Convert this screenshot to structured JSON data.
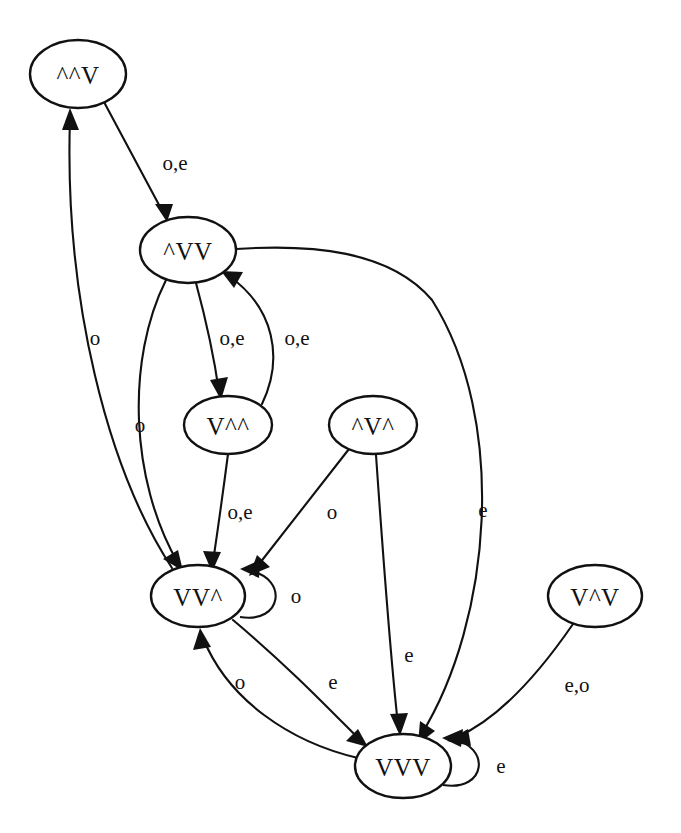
{
  "diagram": {
    "type": "finite-state-machine",
    "title": "",
    "background_color": "#ffffff",
    "line_color": "#111111",
    "node_fill": "#ffffff",
    "nodes": [
      {
        "id": "n0",
        "label": "^^V",
        "cx": 78,
        "cy": 74,
        "rx": 48,
        "ry": 34
      },
      {
        "id": "n1",
        "label": "^VV",
        "cx": 188,
        "cy": 250,
        "rx": 48,
        "ry": 33
      },
      {
        "id": "n2",
        "label": "V^^",
        "cx": 228,
        "cy": 425,
        "rx": 44,
        "ry": 29
      },
      {
        "id": "n3",
        "label": "^V^",
        "cx": 373,
        "cy": 425,
        "rx": 44,
        "ry": 29
      },
      {
        "id": "n4",
        "label": "VV^",
        "cx": 198,
        "cy": 596,
        "rx": 47,
        "ry": 31
      },
      {
        "id": "n5",
        "label": "V^V",
        "cx": 595,
        "cy": 596,
        "rx": 47,
        "ry": 31
      },
      {
        "id": "n6",
        "label": "VVV",
        "cx": 403,
        "cy": 766,
        "rx": 48,
        "ry": 32
      }
    ],
    "edges": [
      {
        "id": "e0",
        "from": "^^V",
        "to": "^VV",
        "label": "o,e",
        "lx": 175,
        "ly": 163
      },
      {
        "id": "e1",
        "from": "VV^",
        "to": "^^V",
        "label": "o",
        "lx": 95,
        "ly": 338
      },
      {
        "id": "e2",
        "from": "^VV",
        "to": "V^^",
        "label": "o,e",
        "lx": 232,
        "ly": 338
      },
      {
        "id": "e3",
        "from": "V^^",
        "to": "^VV",
        "label": "o,e",
        "lx": 297,
        "ly": 338
      },
      {
        "id": "e4",
        "from": "^VV",
        "to": "VV^",
        "label": "o",
        "lx": 140,
        "ly": 425
      },
      {
        "id": "e5",
        "from": "V^^",
        "to": "VV^",
        "label": "o,e",
        "lx": 240,
        "ly": 512
      },
      {
        "id": "e6",
        "from": "^V^",
        "to": "VV^",
        "label": "o",
        "lx": 332,
        "ly": 512
      },
      {
        "id": "e7",
        "from": "^V^",
        "to": "VVV",
        "label": "e",
        "lx": 409,
        "ly": 655
      },
      {
        "id": "e8",
        "from": "VVV",
        "to": "^VV",
        "label": "e",
        "lx": 483,
        "ly": 510
      },
      {
        "id": "e9",
        "from": "VVV",
        "to": "VV^",
        "label": "o",
        "lx": 240,
        "ly": 682
      },
      {
        "id": "e10",
        "from": "VV^",
        "to": "VVV",
        "label": "e",
        "lx": 333,
        "ly": 682
      },
      {
        "id": "e11",
        "from": "V^V",
        "to": "VVV",
        "label": "e,o",
        "lx": 577,
        "ly": 685
      },
      {
        "id": "e12",
        "from": "VV^",
        "to": "VV^",
        "label": "o",
        "lx": 296,
        "ly": 596,
        "self_loop": true
      },
      {
        "id": "e13",
        "from": "VVV",
        "to": "VVV",
        "label": "e",
        "lx": 501,
        "ly": 766,
        "self_loop": true
      }
    ]
  }
}
